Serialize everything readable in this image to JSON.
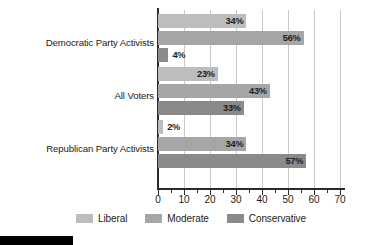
{
  "chart_data": {
    "type": "bar",
    "orientation": "horizontal",
    "title": "",
    "subtitle": "",
    "xlabel": "",
    "ylabel": "",
    "xlim": [
      0,
      70
    ],
    "xticks": [
      0,
      10,
      20,
      30,
      40,
      50,
      60,
      70
    ],
    "xticklabels": [
      "0",
      "10",
      "20",
      "30",
      "40",
      "50",
      "60",
      "70"
    ],
    "grid": true,
    "grid_axis": "x",
    "legend_position": "bottom-center",
    "value_suffix": "%",
    "categories": [
      "Democratic Party Activists",
      "All Voters",
      "Republican Party Activists"
    ],
    "series": [
      {
        "name": "Liberal",
        "color": "#bdbdbd",
        "values": [
          34,
          23,
          2
        ],
        "labels": [
          "34%",
          "23%",
          "2%"
        ]
      },
      {
        "name": "Moderate",
        "color": "#a6a6a6",
        "values": [
          56,
          43,
          34
        ],
        "labels": [
          "56%",
          "43%",
          "34%"
        ]
      },
      {
        "name": "Conservative",
        "color": "#8a8a8a",
        "values": [
          4,
          33,
          57
        ],
        "labels": [
          "4%",
          "33%",
          "57%"
        ]
      }
    ],
    "colors": {
      "liberal": "#bdbdbd",
      "moderate": "#a6a6a6",
      "conservative": "#8a8a8a",
      "axis": "#2b2b2b",
      "grid": "#c9c9c9",
      "text": "#1b1b1b",
      "background": "#ffffff",
      "footer_bar": "#000000"
    }
  },
  "legend": {
    "items": [
      {
        "label": "Liberal",
        "color": "#bdbdbd"
      },
      {
        "label": "Moderate",
        "color": "#a6a6a6"
      },
      {
        "label": "Conservative",
        "color": "#8a8a8a"
      }
    ]
  }
}
